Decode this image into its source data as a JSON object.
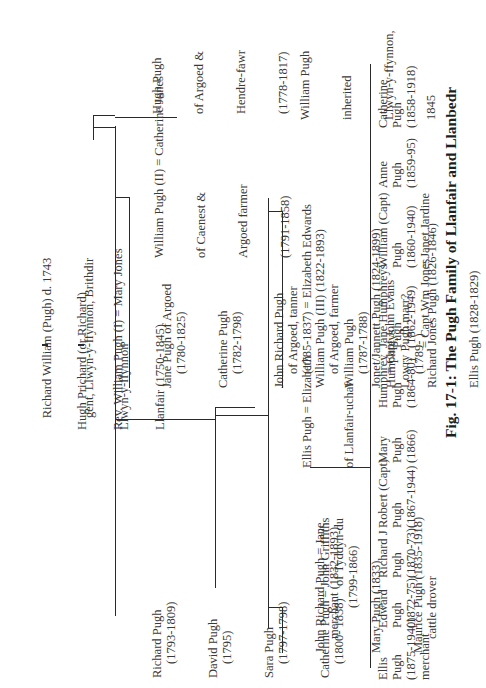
{
  "caption": "Fig. 17-1: The Pugh Family of Llanfair and Llanbedr",
  "ancestors": {
    "richard_william": [
      "Richard William (Pugh) d. 1743",
      "gent, Llwyn-y-ffynnon, Brithdir"
    ],
    "hugh_prichard": [
      "Hugh Prichard (or Richard)",
      "Llwyn-y-ffynnon"
    ],
    "rev_william": [
      "Rev. William Pugh (I) = Mary Jones",
      "Llanfair (1750-1845)"
    ]
  },
  "gen2": {
    "hugh_pugh": [
      "Hugh Pugh",
      "of Argoed &",
      "Hendre-fawr",
      "(1778-1817)"
    ],
    "siblings": [
      [
        "Jane Pugh of Argoed",
        "(1780-1825)"
      ],
      [
        "Catherine Pugh",
        "(1782-1798)"
      ],
      [
        "John Richard Pugh",
        "of Argoed, tanner",
        "(1785-1837) = Elizabeth Edwards"
      ],
      [
        "William Pugh",
        "(1787-1788)"
      ],
      [
        "Lowry Pugh marr?",
        "(1789- )"
      ]
    ],
    "william_ii": [
      "William Pugh (II) = Catherine Jones",
      "of Caenest &",
      "Argoed farmer",
      "(1791-1858)"
    ],
    "william_ii_children": [
      [
        "Richard Pugh",
        "(1793-1809)"
      ],
      [
        "David Pugh",
        "(1795)"
      ],
      [
        "Sara Pugh",
        "(1797-1798)"
      ],
      [
        "Catherine Pugh = John Griffiths",
        "(1800- 1838)    of Tyddyn-du",
        "(1799-1866)"
      ]
    ]
  },
  "gen3": {
    "william_inherited": [
      "William Pugh",
      "inherited",
      "Llwyn-y-ffynnon,",
      "1845"
    ],
    "children": [
      [
        "William Pugh (III) (1822-1893)",
        "of Argoed, farmer"
      ],
      [
        "Jonet/Jannett Pugh (1824-1899)",
        "= Capt John Evans"
      ],
      [
        "Richard Jones Pugh (1826-1846)"
      ],
      [
        "Ellis Pugh (1828-1829)"
      ]
    ],
    "ellis": [
      "Ellis Pugh = Elizabeth",
      "of Llanfair-uchaf",
      "Humphreys"
    ],
    "other": [
      [
        "John Richard Pugh = Jane",
        "merchant (1832-1893)"
      ],
      [
        "Mary Pugh (1833)"
      ],
      [
        "Maurice Pugh (1835-1918)",
        "cattle drover"
      ]
    ]
  },
  "gen4": [
    [
      "Catherine",
      "Pugh",
      "(1858-1918)"
    ],
    [
      "Anne",
      "Pugh",
      "(1859-95)"
    ],
    [
      "William (Capt)",
      "Pugh",
      "(1860-1940)",
      "= Janet Jardine"
    ],
    [
      "Jane Humphreys",
      "Pugh",
      "(1862-1949)",
      "= Capt Wm Jones"
    ],
    [
      "Humphrey",
      "Pugh",
      "(1864-80)"
    ],
    [
      "Mary",
      "Pugh",
      "(1866)"
    ],
    [
      "Robert (Capt)",
      "Pugh",
      "(1867-1944)"
    ],
    [
      "Richard J",
      "Pugh",
      "(1870-73)"
    ],
    [
      "Edward",
      "Pugh",
      "(1872-75)"
    ],
    [
      "Ellis",
      "Pugh",
      "(1875-1940)",
      "merchant"
    ]
  ]
}
